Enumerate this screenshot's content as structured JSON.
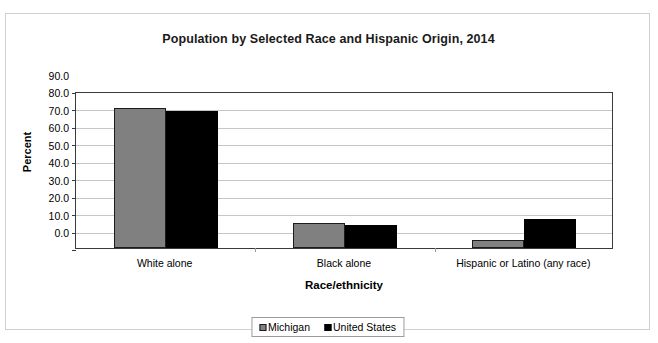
{
  "chart_data": {
    "type": "bar",
    "title": "Population by Selected Race and Hispanic Origin, 2014",
    "xlabel": "Race/ethnicity",
    "ylabel": "Percent",
    "categories": [
      "White alone",
      "Black alone",
      "Hispanic or Latino (any race)"
    ],
    "series": [
      {
        "name": "Michigan",
        "color": "#808080",
        "values": [
          80.5,
          14.2,
          4.8
        ]
      },
      {
        "name": "United States",
        "color": "#000000",
        "values": [
          78.8,
          13.2,
          16.9
        ]
      }
    ],
    "ylim": [
      0.0,
      90.0
    ],
    "ytick_step": 10.0,
    "yticks": [
      "90.0",
      "80.0",
      "70.0",
      "60.0",
      "50.0",
      "40.0",
      "30.0",
      "20.0",
      "10.0",
      "0.0"
    ],
    "ytick_values": [
      90.0,
      80.0,
      70.0,
      60.0,
      50.0,
      40.0,
      30.0,
      20.0,
      10.0,
      0.0
    ],
    "grid": true,
    "grid_color": "#c6c6c6",
    "legend_position": "bottom",
    "plot_border_color": "#3a3a3a",
    "background": "#ffffff"
  }
}
